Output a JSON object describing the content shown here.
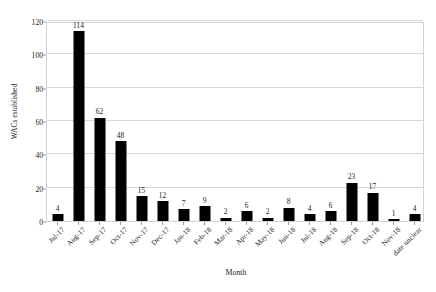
{
  "chart_data": {
    "type": "bar",
    "title": "",
    "xlabel": "Month",
    "ylabel": "WACs established",
    "categories": [
      "Jul-17",
      "Aug-17",
      "Sep-17",
      "Oct-17",
      "Nov-17",
      "Dec-17",
      "Jan-18",
      "Feb-18",
      "Mar-18",
      "Apr-18",
      "May-18",
      "Jun-18",
      "Jul-18",
      "Aug-18",
      "Sep-18",
      "Oct-18",
      "Nov-18",
      "date unclear"
    ],
    "values": [
      4,
      114,
      62,
      48,
      15,
      12,
      7,
      9,
      2,
      6,
      2,
      8,
      4,
      6,
      23,
      17,
      1,
      4
    ],
    "ylim": [
      0,
      120
    ],
    "yticks": [
      0,
      20,
      40,
      60,
      80,
      100,
      120
    ],
    "grid": true,
    "legend": false,
    "bar_color": "#000000",
    "gridline_color": "#d8d8d8",
    "frame_color": "#d2d2d2"
  }
}
